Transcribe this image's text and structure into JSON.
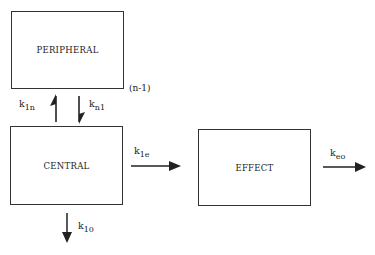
{
  "diagram": {
    "type": "pharmacokinetic-compartment-model",
    "boxes": {
      "peripheral": "PERIPHERAL",
      "central": "CENTRAL",
      "effect": "EFFECT"
    },
    "annotations": {
      "peripheral_multiplicity": "(n-1)"
    },
    "rate_constants": {
      "k1n": {
        "base": "k",
        "sub": "1n"
      },
      "kn1": {
        "base": "k",
        "sub": "n1"
      },
      "k1e": {
        "base": "k",
        "sub": "1e"
      },
      "keo": {
        "base": "k",
        "sub": "eo"
      },
      "k10": {
        "base": "k",
        "sub": "10"
      }
    },
    "edges": [
      {
        "from": "central",
        "to": "peripheral",
        "label": "k1n"
      },
      {
        "from": "peripheral",
        "to": "central",
        "label": "kn1"
      },
      {
        "from": "central",
        "to": "effect",
        "label": "k1e"
      },
      {
        "from": "effect",
        "to": "out",
        "label": "keo"
      },
      {
        "from": "central",
        "to": "out",
        "label": "k10"
      }
    ]
  }
}
